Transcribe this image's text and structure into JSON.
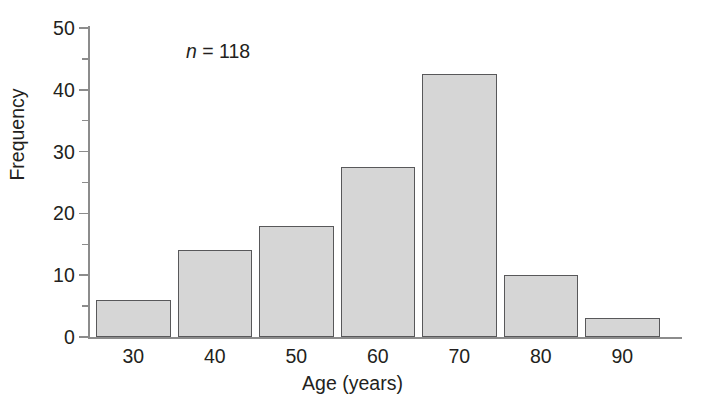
{
  "chart_data": {
    "type": "bar",
    "title": "",
    "subtitle": "",
    "xlabel": "Age (years)",
    "ylabel": "Frequency",
    "categories": [
      "30",
      "40",
      "50",
      "60",
      "70",
      "80",
      "90"
    ],
    "values": [
      6,
      14,
      18,
      27.5,
      42.5,
      10,
      3
    ],
    "series": [
      {
        "name": "Frequency",
        "values": [
          6,
          14,
          18,
          27.5,
          42.5,
          10,
          3
        ]
      }
    ],
    "xlim": [
      25,
      95
    ],
    "ylim": [
      0,
      50
    ],
    "ytick_labels": [
      "0",
      "10",
      "20",
      "30",
      "40",
      "50"
    ],
    "ytick_values": [
      0,
      10,
      20,
      30,
      40,
      50
    ],
    "yminor_tick_values": [
      5,
      15,
      25,
      35,
      45
    ],
    "xtick_labels": [
      "30",
      "40",
      "50",
      "60",
      "70",
      "80",
      "90"
    ],
    "grid": false,
    "legend": false,
    "legend_position": "none",
    "annotations": [
      {
        "name": "sample-size",
        "symbol": "n",
        "text": " = 118",
        "value": 118
      }
    ],
    "bar_fill_color": "#d6d6d6",
    "bar_edge_color": "#58585a",
    "axis_color": "#8c8c8c",
    "text_color": "#231f20",
    "background_color": "#ffffff"
  }
}
